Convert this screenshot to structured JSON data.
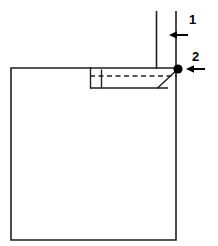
{
  "figure": {
    "type": "technical-line-drawing",
    "width": 218,
    "height": 246,
    "background_color": "#ffffff",
    "line_color": "#231f20",
    "callouts": [
      {
        "id": "1",
        "label": "1",
        "label_x": 193,
        "label_y": 20,
        "arrow_x_tip": 170,
        "arrow_x_tail": 188,
        "arrow_y": 35,
        "direction": "left"
      },
      {
        "id": "2",
        "label": "2",
        "label_x": 196,
        "label_y": 57,
        "arrow_x_tip": 185,
        "arrow_x_tail": 205,
        "arrow_y": 69,
        "direction": "left"
      }
    ],
    "markers": [
      {
        "name": "node-dot",
        "x": 178,
        "y": 69,
        "radius": 4.5,
        "color": "#000000"
      }
    ],
    "geometry": {
      "body_rect": {
        "x1": 11,
        "y1": 68,
        "x2": 176,
        "y2": 240
      },
      "vertical_line_inner": {
        "x": 156,
        "y1": 11,
        "y2": 69
      },
      "vertical_line_outer": {
        "x": 176,
        "y1": 11,
        "y2": 240
      },
      "pocket_left_edge": {
        "x": 90,
        "y1": 68,
        "y2": 88
      },
      "pocket_divider": {
        "x": 101,
        "y1": 70,
        "y2": 88
      },
      "pocket_bottom": {
        "x1": 90,
        "y1": 88,
        "x2": 167,
        "y2": 88
      },
      "dashed_line": {
        "x1": 90,
        "y1": 76,
        "x2": 176,
        "y2": 76,
        "dash": "5 3"
      },
      "diagonal_chamfer": {
        "x1": 178,
        "y1": 69,
        "x2": 157,
        "y2": 88
      }
    }
  }
}
